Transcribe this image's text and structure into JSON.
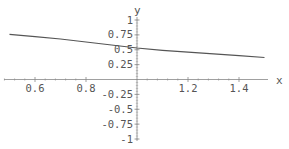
{
  "chart_data": {
    "type": "line",
    "title": "",
    "xlabel": "x",
    "ylabel": "y",
    "xlim": [
      0.5,
      1.5
    ],
    "ylim": [
      -1,
      1
    ],
    "grid": false,
    "legend": null,
    "x_ticks": [
      0.6,
      0.8,
      1.2,
      1.4
    ],
    "x_tick_labels": [
      "0.6",
      "0.8",
      "1.2",
      "1.4"
    ],
    "y_ticks": [
      1,
      0.75,
      0.5,
      0.25,
      -0.25,
      -0.5,
      -0.75,
      -1
    ],
    "y_tick_labels": [
      "1",
      "0.75",
      "0.5",
      "0.25",
      "-0.25",
      "-0.5",
      "-0.75",
      "-1"
    ],
    "series": [
      {
        "name": "curve",
        "x": [
          0.5,
          0.6,
          0.7,
          0.8,
          0.9,
          1.0,
          1.1,
          1.2,
          1.3,
          1.4,
          1.5
        ],
        "y": [
          0.76,
          0.72,
          0.68,
          0.63,
          0.58,
          0.53,
          0.49,
          0.46,
          0.43,
          0.4,
          0.37
        ],
        "color": "#555555"
      }
    ]
  },
  "colors": {
    "axis": "#888888",
    "curve": "#555555",
    "text": "#555555"
  }
}
